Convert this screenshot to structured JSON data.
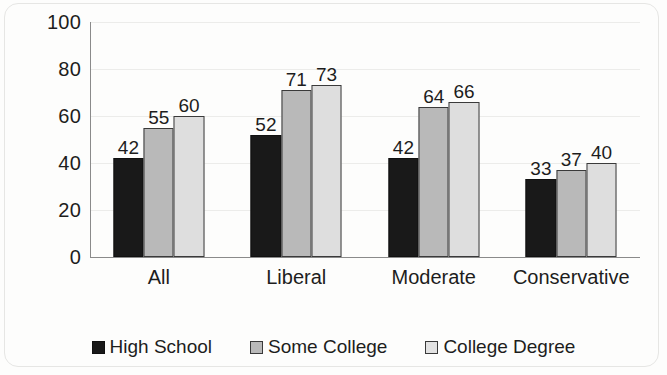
{
  "chart_data": {
    "type": "bar",
    "title": "",
    "subtitle": "",
    "xlabel": "",
    "ylabel": "",
    "categories": [
      "All",
      "Liberal",
      "Moderate",
      "Conservative"
    ],
    "series": [
      {
        "name": "High School",
        "values": [
          42,
          52,
          42,
          33
        ],
        "color": "#191919"
      },
      {
        "name": "Some College",
        "values": [
          55,
          71,
          64,
          37
        ],
        "color": "#b9b9b9"
      },
      {
        "name": "College Degree",
        "values": [
          60,
          73,
          66,
          40
        ],
        "color": "#dedede"
      }
    ],
    "ylim": [
      0,
      100
    ],
    "yticks": [
      0,
      20,
      40,
      60,
      80,
      100
    ],
    "ytick_labels": [
      "0",
      "20",
      "40",
      "60",
      "80",
      "100"
    ],
    "grid": true,
    "grid_axis": "y",
    "legend_position": "bottom",
    "data_labels": true,
    "bar_border_color": "#3a3a3a"
  },
  "axis": {
    "y": {
      "labels": [
        "100",
        "80",
        "60",
        "40",
        "20",
        "0"
      ]
    }
  },
  "categories": [
    {
      "label": "All"
    },
    {
      "label": "Liberal"
    },
    {
      "label": "Moderate"
    },
    {
      "label": "Conservative"
    }
  ],
  "groups": [
    {
      "name": "All",
      "bars": [
        {
          "series": "High School",
          "value": "42"
        },
        {
          "series": "Some College",
          "value": "55"
        },
        {
          "series": "College Degree",
          "value": "60"
        }
      ]
    },
    {
      "name": "Liberal",
      "bars": [
        {
          "series": "High School",
          "value": "52"
        },
        {
          "series": "Some College",
          "value": "71"
        },
        {
          "series": "College Degree",
          "value": "73"
        }
      ]
    },
    {
      "name": "Moderate",
      "bars": [
        {
          "series": "High School",
          "value": "42"
        },
        {
          "series": "Some College",
          "value": "64"
        },
        {
          "series": "College Degree",
          "value": "66"
        }
      ]
    },
    {
      "name": "Conservative",
      "bars": [
        {
          "series": "High School",
          "value": "33"
        },
        {
          "series": "Some College",
          "value": "37"
        },
        {
          "series": "College Degree",
          "value": "40"
        }
      ]
    }
  ],
  "legend": {
    "items": [
      {
        "label": "High School",
        "swatch": "legend-swatch-high-school"
      },
      {
        "label": "Some College",
        "swatch": "legend-swatch-some-college"
      },
      {
        "label": "College Degree",
        "swatch": "legend-swatch-college-degree"
      }
    ]
  }
}
